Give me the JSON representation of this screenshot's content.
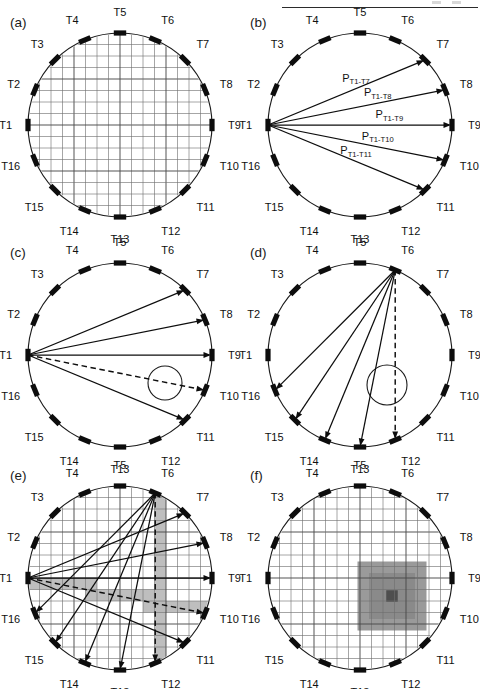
{
  "figure": {
    "width": 480,
    "height": 689,
    "background": "#ffffff",
    "ink_color": "#0d0d0d",
    "grid_color": "#6e6e6e",
    "shade_color": "#b9b9b9",
    "blob_outer_color": "#9a9a9a",
    "blob_core_color": "#4e4e4e",
    "header_rule": true
  },
  "transducer_labels": [
    "T1",
    "T2",
    "T3",
    "T4",
    "T5",
    "T6",
    "T7",
    "T8",
    "T9",
    "T10",
    "T11",
    "T12",
    "T13",
    "T14",
    "T15",
    "T16"
  ],
  "transducer_count": 16,
  "geometry": {
    "note": "16 transducers equally spaced, T1 at left (180 deg), numbering clockwise toward top",
    "start_angle_deg": 180,
    "step_deg": -22.5,
    "grid_cells_across": 16
  },
  "panels": [
    {
      "id": "a",
      "letter": "(a)",
      "name": "sensor-array-grid",
      "cx": 120,
      "cy": 125,
      "r": 92,
      "show_grid": true,
      "rays": [],
      "dashed_rays": [],
      "anomaly": null,
      "shaded_cells": false,
      "blob": null,
      "ray_labels": []
    },
    {
      "id": "b",
      "letter": "(b)",
      "name": "ray-paths-from-t1-labeled",
      "cx": 360,
      "cy": 125,
      "r": 92,
      "show_grid": false,
      "rays": [
        {
          "from": "T1",
          "to": "T7"
        },
        {
          "from": "T1",
          "to": "T8"
        },
        {
          "from": "T1",
          "to": "T9"
        },
        {
          "from": "T1",
          "to": "T10"
        },
        {
          "from": "T1",
          "to": "T11"
        }
      ],
      "dashed_rays": [],
      "anomaly": null,
      "shaded_cells": false,
      "blob": null,
      "ray_labels": [
        {
          "base": "P",
          "sub": "T1-T7",
          "to": "T7",
          "t": 0.56,
          "dy": -7
        },
        {
          "base": "P",
          "sub": "T1-T8",
          "to": "T8",
          "t": 0.62,
          "dy": -7
        },
        {
          "base": "P",
          "sub": "T1-T9",
          "to": "T9",
          "t": 0.66,
          "dy": -7
        },
        {
          "base": "P",
          "sub": "T1-T10",
          "to": "T10",
          "t": 0.62,
          "dy": -7
        },
        {
          "base": "P",
          "sub": "T1-T11",
          "to": "T11",
          "t": 0.56,
          "dy": -7
        }
      ]
    },
    {
      "id": "c",
      "letter": "(c)",
      "name": "ray-paths-from-t1-with-anomaly",
      "cx": 120,
      "cy": 355,
      "r": 92,
      "show_grid": false,
      "rays": [
        {
          "from": "T1",
          "to": "T7"
        },
        {
          "from": "T1",
          "to": "T8"
        },
        {
          "from": "T1",
          "to": "T9"
        },
        {
          "from": "T1",
          "to": "T11"
        }
      ],
      "dashed_rays": [
        {
          "from": "T1",
          "to": "T10"
        }
      ],
      "anomaly": {
        "dx": 45,
        "dy": 28,
        "r": 17
      },
      "shaded_cells": false,
      "blob": null,
      "ray_labels": []
    },
    {
      "id": "d",
      "letter": "(d)",
      "name": "ray-paths-from-t6-with-anomaly",
      "cx": 360,
      "cy": 355,
      "r": 92,
      "show_grid": false,
      "rays": [
        {
          "from": "T6",
          "to": "T16"
        },
        {
          "from": "T6",
          "to": "T15"
        },
        {
          "from": "T6",
          "to": "T14"
        },
        {
          "from": "T6",
          "to": "T13"
        }
      ],
      "dashed_rays": [
        {
          "from": "T6",
          "to": "T12"
        }
      ],
      "anomaly": {
        "dx": 27,
        "dy": 30,
        "r": 20
      },
      "shaded_cells": false,
      "blob": null,
      "ray_labels": []
    },
    {
      "id": "e",
      "letter": "(e)",
      "name": "combined-ray-paths-over-grid",
      "cx": 120,
      "cy": 578,
      "r": 92,
      "show_grid": true,
      "rays": [
        {
          "from": "T1",
          "to": "T7"
        },
        {
          "from": "T1",
          "to": "T8"
        },
        {
          "from": "T1",
          "to": "T9"
        },
        {
          "from": "T1",
          "to": "T11"
        },
        {
          "from": "T6",
          "to": "T16"
        },
        {
          "from": "T6",
          "to": "T15"
        },
        {
          "from": "T6",
          "to": "T14"
        },
        {
          "from": "T6",
          "to": "T13"
        }
      ],
      "dashed_rays": [
        {
          "from": "T1",
          "to": "T10"
        },
        {
          "from": "T6",
          "to": "T12"
        }
      ],
      "anomaly": null,
      "shaded_cells": true,
      "shade_paths": [
        {
          "from": "T1",
          "to": "T10"
        },
        {
          "from": "T6",
          "to": "T12"
        }
      ],
      "blob": null,
      "ray_labels": []
    },
    {
      "id": "f",
      "letter": "(f)",
      "name": "reconstructed-image",
      "cx": 360,
      "cy": 578,
      "r": 92,
      "show_grid": true,
      "rays": [],
      "dashed_rays": [],
      "anomaly": null,
      "shaded_cells": false,
      "blob": {
        "dx": 32,
        "dy": 18,
        "outer_cells": 6,
        "mid_cells": 4,
        "core_cells": 1
      },
      "ray_labels": []
    }
  ]
}
